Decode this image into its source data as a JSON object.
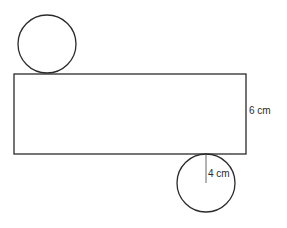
{
  "diagram": {
    "type": "cylinder-net",
    "stroke_color": "#2b2b2b",
    "background": "#ffffff",
    "shapes": {
      "top_circle": {
        "cx": 47,
        "cy": 44,
        "r": 29
      },
      "rectangle": {
        "x": 14,
        "y": 74,
        "width": 232,
        "height": 80
      },
      "bottom_circle": {
        "cx": 206,
        "cy": 183,
        "r": 29
      },
      "radius_line": {
        "x1": 206,
        "y1": 154,
        "x2": 206,
        "y2": 183
      }
    },
    "labels": {
      "height": "6 cm",
      "radius": "4 cm"
    }
  }
}
